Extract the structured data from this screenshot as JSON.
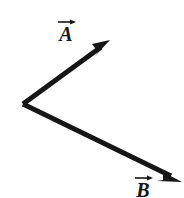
{
  "figure": {
    "type": "vector-diagram",
    "background_color": "#ffffff",
    "stroke_color": "#161616",
    "width": 184,
    "height": 198,
    "origin": {
      "x": 23,
      "y": 104
    }
  },
  "vectors": [
    {
      "id": "A",
      "label": "A",
      "label_has_overarrow": true,
      "overarrow_icon": "right-arrow-accent",
      "start": {
        "x": 23,
        "y": 104
      },
      "end": {
        "x": 110,
        "y": 40
      },
      "direction": "up-right",
      "stroke_width": 5,
      "label_position": {
        "x": 55,
        "y": 18
      }
    },
    {
      "id": "B",
      "label": "B",
      "label_has_overarrow": true,
      "overarrow_icon": "right-arrow-accent",
      "start": {
        "x": 23,
        "y": 104
      },
      "end": {
        "x": 182,
        "y": 182
      },
      "direction": "down-right",
      "stroke_width": 5,
      "label_position": {
        "x": 132,
        "y": 174
      }
    }
  ]
}
